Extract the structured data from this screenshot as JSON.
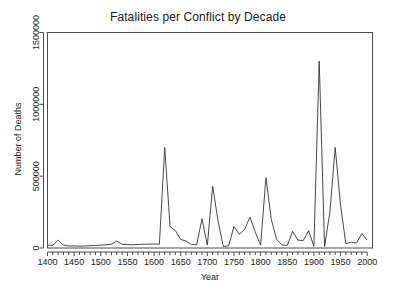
{
  "chart_data": {
    "type": "line",
    "title": "Fatalities per Conflict by Decade",
    "xlabel": "Year",
    "ylabel": "Number of Deaths",
    "xlim": [
      1400,
      2010
    ],
    "ylim": [
      0,
      1500000
    ],
    "grid": false,
    "legend": null,
    "xticks": [
      1400,
      1450,
      1500,
      1550,
      1600,
      1650,
      1700,
      1750,
      1800,
      1850,
      1900,
      1950,
      2000
    ],
    "xtick_labels": [
      "1400",
      "1450",
      "1500",
      "1550",
      "1600",
      "1650",
      "1700",
      "1750",
      "1800",
      "1850",
      "1900",
      "1950",
      "2000"
    ],
    "xminor_step": 10,
    "yticks": [
      0,
      500000,
      1000000,
      1500000
    ],
    "ytick_labels": [
      "0",
      "500000",
      "1000000",
      "1500000"
    ],
    "series": [
      {
        "name": "Fatalities per Conflict",
        "color": "#333333",
        "x": [
          1400,
          1410,
          1420,
          1430,
          1440,
          1450,
          1460,
          1470,
          1480,
          1490,
          1500,
          1510,
          1520,
          1530,
          1540,
          1550,
          1560,
          1570,
          1580,
          1590,
          1600,
          1610,
          1620,
          1630,
          1640,
          1650,
          1660,
          1670,
          1680,
          1690,
          1700,
          1710,
          1720,
          1730,
          1740,
          1750,
          1760,
          1770,
          1780,
          1790,
          1800,
          1810,
          1820,
          1830,
          1840,
          1850,
          1860,
          1870,
          1880,
          1890,
          1900,
          1910,
          1920,
          1930,
          1940,
          1950,
          1960,
          1970,
          1980,
          1990,
          2000
        ],
        "values": [
          20000,
          18000,
          55000,
          20000,
          15000,
          14000,
          13000,
          14000,
          16000,
          17000,
          20000,
          22000,
          26000,
          48000,
          26000,
          24000,
          22000,
          25000,
          26000,
          27000,
          28000,
          26000,
          700000,
          150000,
          120000,
          60000,
          48000,
          25000,
          22000,
          205000,
          20000,
          430000,
          190000,
          10000,
          15000,
          150000,
          95000,
          130000,
          215000,
          110000,
          20000,
          490000,
          200000,
          60000,
          22000,
          18000,
          115000,
          55000,
          52000,
          120000,
          12000,
          1300000,
          10000,
          250000,
          700000,
          300000,
          30000,
          40000,
          35000,
          100000,
          55000
        ]
      }
    ]
  },
  "axes": {
    "title": "Fatalities per Conflict by Decade",
    "x_axis_label": "Year",
    "y_axis_label": "Number of Deaths"
  }
}
